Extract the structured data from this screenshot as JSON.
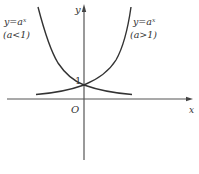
{
  "diagram": {
    "axes": {
      "x_label": "x",
      "y_label": "y",
      "origin_label": "O",
      "y_intercept_label": "1"
    },
    "curves": [
      {
        "name": "decreasing",
        "label_line1": "y=aˣ",
        "label_line2": "(a<1)"
      },
      {
        "name": "increasing",
        "label_line1": "y=aˣ",
        "label_line2": "(a>1)"
      }
    ],
    "colors": {
      "stroke": "#333333",
      "axis": "#555555",
      "background": "#ffffff"
    }
  }
}
